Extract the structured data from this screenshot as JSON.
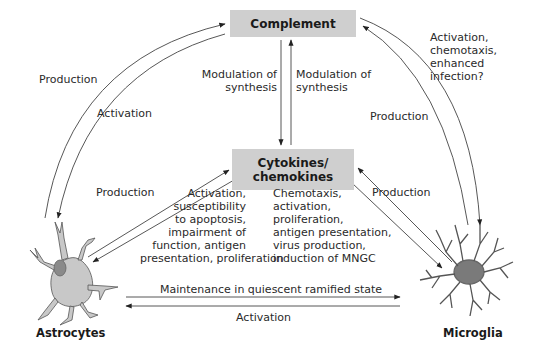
{
  "nodes": {
    "complement": "Complement",
    "cytokines": [
      "Cytokines/",
      "chemokines"
    ],
    "astrocytes": "Astrocytes",
    "microglia": "Microglia"
  },
  "edges": {
    "astro_to_complement": "Production",
    "complement_to_astro": "Activation",
    "complement_to_cytokines": [
      "Modulation of",
      "synthesis"
    ],
    "cytokines_to_complement": [
      "Modulation of",
      "synthesis"
    ],
    "microglia_to_complement": "Production",
    "complement_to_microglia": [
      "Activation,",
      "chemotaxis,",
      "enhanced",
      "infection?"
    ],
    "astro_to_cytokines": "Production",
    "cytokines_to_astro": [
      "Activation,",
      "susceptibility",
      "to apoptosis,",
      "impairment of",
      "function, antigen",
      "presentation, proliferation"
    ],
    "microglia_to_cytokines": "Production",
    "cytokines_to_microglia": [
      "Chemotaxis,",
      "activation,",
      "proliferation,",
      "antigen presentation,",
      "virus production,",
      "induction of MNGC"
    ],
    "astro_to_microglia": "Maintenance in quiescent ramified state",
    "microglia_to_astro": "Activation"
  },
  "colors": {
    "box_fill": "#cfcfcf",
    "astrocyte_fill": "#c8c8c8",
    "astrocyte_nucleus": "#8a8a8a",
    "microglia_fill": "#7a7a7a",
    "line": "#333333"
  }
}
